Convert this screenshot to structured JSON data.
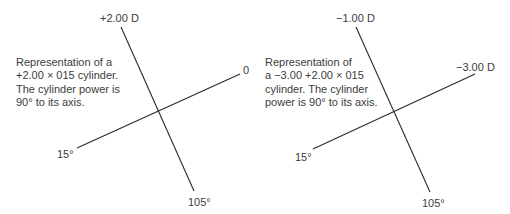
{
  "diagrams": [
    {
      "caption_lines": [
        "Representation of a",
        "+2.00 × 015 cylinder.",
        "The cylinder power is",
        "90° to its axis."
      ],
      "labels": {
        "power_meridian_top": "+2.00 D",
        "axis_right": "0",
        "axis_left": "15°",
        "power_meridian_bottom": "105°"
      }
    },
    {
      "caption_lines": [
        "Representation of",
        "a −3.00 +2.00 × 015",
        "cylinder. The cylinder",
        "power is 90° to its axis."
      ],
      "labels": {
        "power_meridian_top": "−1.00 D",
        "axis_right": "−3.00 D",
        "axis_left": "15°",
        "power_meridian_bottom": "105°"
      }
    }
  ],
  "colors": {
    "line": "#2a2a2a",
    "text": "#3c3c3c"
  }
}
